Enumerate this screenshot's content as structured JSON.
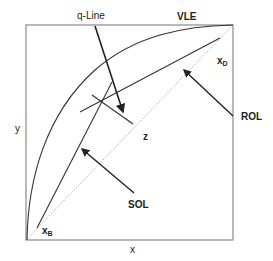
{
  "diagram": {
    "type": "McCabe-Thiele diagram",
    "axes": {
      "x_label": "x",
      "y_label": "y"
    },
    "curves": {
      "vle": {
        "label": "VLE"
      },
      "rol": {
        "label": "ROL"
      },
      "sol": {
        "label": "SOL"
      },
      "q_line": {
        "label": "q-Line"
      },
      "diagonal": {
        "style": "dotted"
      }
    },
    "points": {
      "xd": {
        "main": "x",
        "sub": "D"
      },
      "xb": {
        "main": "x",
        "sub": "B"
      },
      "z": {
        "label": "z"
      }
    },
    "colors": {
      "line": "#333333",
      "frame": "#888888",
      "diagonal": "#999999"
    }
  }
}
